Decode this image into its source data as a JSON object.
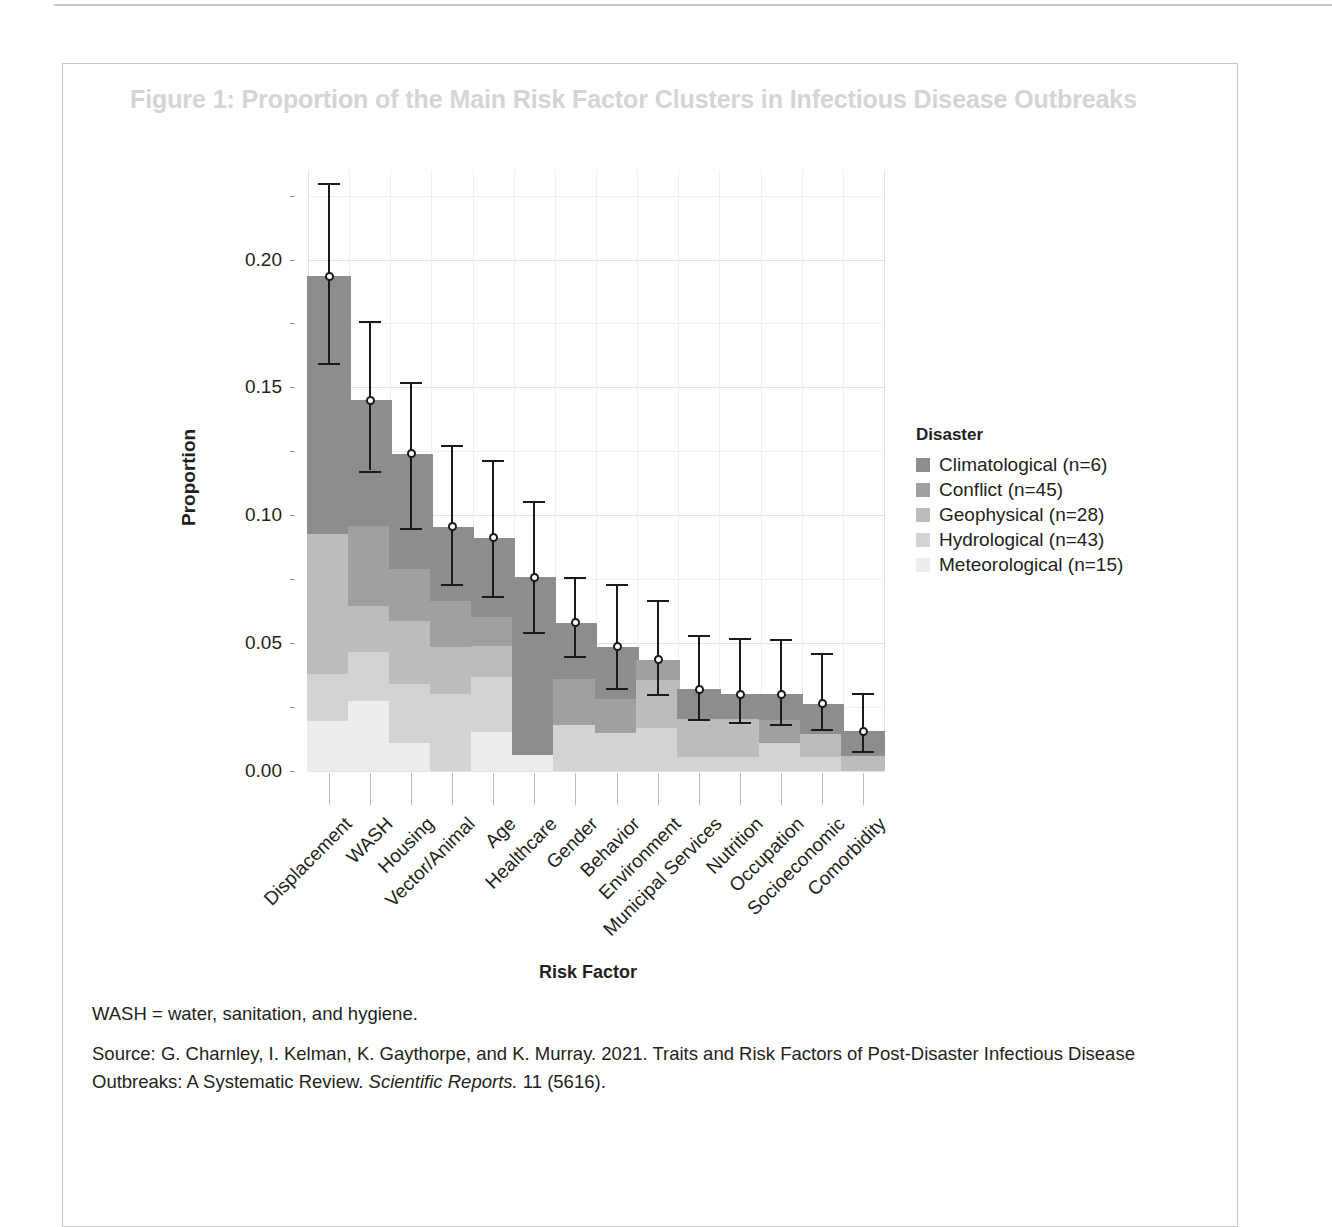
{
  "figure": {
    "title": "Figure 1: Proportion of the Main Risk Factor Clusters in Infectious Disease Outbreaks",
    "xlabel": "Risk Factor",
    "ylabel": "Proportion",
    "legend_title": "Disaster"
  },
  "notes": {
    "abbreviation": "WASH = water, sanitation, and hygiene.",
    "source_part1": "Source: G. Charnley, I. Kelman, K. Gaythorpe, and K. Murray. 2021. Traits and Risk Factors of Post-Disaster Infectious Disease Outbreaks: A Systematic Review. ",
    "source_italic": "Scientific Reports.",
    "source_part2": " 11 (5616)."
  },
  "chart_data": {
    "type": "bar",
    "stacked": true,
    "title": "Figure 1: Proportion of the Main Risk Factor Clusters in Infectious Disease Outbreaks",
    "xlabel": "Risk Factor",
    "ylabel": "Proportion",
    "ylim": [
      0.0,
      0.235
    ],
    "yticks": [
      0.0,
      0.05,
      0.1,
      0.15,
      0.2
    ],
    "ytick_labels": [
      "0.00",
      "0.05",
      "0.10",
      "0.15",
      "0.20"
    ],
    "yminor_ticks": [
      0.025,
      0.075,
      0.125,
      0.175,
      0.225
    ],
    "grid": true,
    "legend_position": "right",
    "legend_title": "Disaster",
    "categories": [
      "Displacement",
      "WASH",
      "Housing",
      "Vector/Animal",
      "Age",
      "Healthcare",
      "Gender",
      "Behavior",
      "Environment",
      "Municipal Services",
      "Nutrition",
      "Occupation",
      "Socioeconomic",
      "Comorbidity"
    ],
    "series": [
      {
        "name": "Meteorological (n=15)",
        "color": "#ededed",
        "values": [
          0.0195,
          0.0272,
          0.011,
          0.0,
          0.0152,
          0.0062,
          0.0,
          0.0,
          0.0,
          0.0,
          0.0,
          0.0,
          0.0,
          0.0
        ]
      },
      {
        "name": "Hydrological (n=43)",
        "color": "#d3d3d3",
        "values": [
          0.0185,
          0.0195,
          0.023,
          0.03,
          0.0215,
          0.0,
          0.018,
          0.015,
          0.017,
          0.0055,
          0.0055,
          0.011,
          0.0054,
          0.0
        ]
      },
      {
        "name": "Geophysical (n=28)",
        "color": "#bcbcbc",
        "values": [
          0.0545,
          0.0178,
          0.0248,
          0.0185,
          0.012,
          0.0,
          0.0,
          0.0,
          0.0185,
          0.015,
          0.015,
          0.0,
          0.009,
          0.006
        ]
      },
      {
        "name": "Conflict (n=45)",
        "color": "#a0a0a0",
        "values": [
          0.0,
          0.0315,
          0.02,
          0.018,
          0.0115,
          0.0,
          0.018,
          0.013,
          0.008,
          0.0,
          0.0,
          0.009,
          0.0,
          0.0
        ]
      },
      {
        "name": "Climatological (n=6)",
        "color": "#8d8d8d",
        "values": [
          0.101,
          0.049,
          0.0452,
          0.029,
          0.031,
          0.0695,
          0.022,
          0.0205,
          0.0,
          0.0115,
          0.0095,
          0.01,
          0.012,
          0.0095
        ]
      }
    ],
    "totals": [
      0.1935,
      0.145,
      0.124,
      0.0955,
      0.0912,
      0.0757,
      0.058,
      0.0485,
      0.0435,
      0.032,
      0.03,
      0.03,
      0.0264,
      0.0155
    ],
    "error_low": [
      0.1595,
      0.1175,
      0.095,
      0.073,
      0.0685,
      0.0545,
      0.045,
      0.0325,
      0.03,
      0.0205,
      0.019,
      0.0185,
      0.0165,
      0.008
    ],
    "error_high": [
      0.23,
      0.176,
      0.152,
      0.1275,
      0.1215,
      0.1055,
      0.076,
      0.073,
      0.067,
      0.053,
      0.052,
      0.0515,
      0.046,
      0.0305
    ]
  }
}
